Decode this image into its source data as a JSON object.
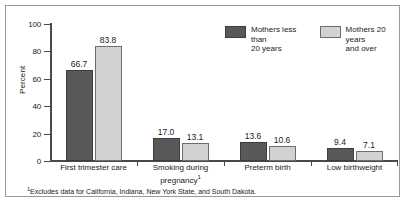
{
  "chart_data": {
    "type": "bar",
    "title": "",
    "xlabel": "",
    "ylabel": "Percent",
    "ylim": [
      0,
      100
    ],
    "yticks": [
      0,
      20,
      40,
      60,
      80,
      100
    ],
    "ytick_labels": [
      "0",
      "20",
      "40",
      "60",
      "80",
      "100"
    ],
    "grid": false,
    "legend_position": "top-right",
    "categories": [
      "First trimester care",
      "Smoking during\npregnancy",
      "Preterm birth",
      "Low birthweight"
    ],
    "category_footnotes": [
      "",
      "1",
      "",
      ""
    ],
    "series": [
      {
        "name": "Mothers less than\n20 years",
        "color": "#595959",
        "values": [
          66.7,
          17.0,
          13.6,
          9.4
        ],
        "value_labels": [
          "66.7",
          "17.0",
          "13.6",
          "9.4"
        ]
      },
      {
        "name": "Mothers 20 years\nand over",
        "color": "#d2d2d2",
        "values": [
          83.8,
          13.1,
          10.6,
          7.1
        ],
        "value_labels": [
          "83.8",
          "13.1",
          "10.6",
          "7.1"
        ]
      }
    ],
    "footnote": "Excludes data for California, Indiana, New York State, and South Dakota.",
    "footnote_marker": "1"
  },
  "legend": {
    "items": [
      {
        "label": "Mothers less than\n20 years",
        "swatch": "dark-swatch-icon"
      },
      {
        "label": "Mothers 20 years\nand over",
        "swatch": "light-swatch-icon"
      }
    ]
  },
  "axis": {
    "y_label": "Percent",
    "y_ticks": [
      "100",
      "80",
      "60",
      "40",
      "20",
      "0"
    ]
  },
  "groups": [
    {
      "label": "First trimester care",
      "footnote": "",
      "bars": [
        {
          "value_label": "66.7",
          "value": 66.7,
          "style": "dark"
        },
        {
          "value_label": "83.8",
          "value": 83.8,
          "style": "light"
        }
      ]
    },
    {
      "label": "Smoking during\npregnancy",
      "footnote": "1",
      "bars": [
        {
          "value_label": "17.0",
          "value": 17.0,
          "style": "dark"
        },
        {
          "value_label": "13.1",
          "value": 13.1,
          "style": "light"
        }
      ]
    },
    {
      "label": "Preterm birth",
      "footnote": "",
      "bars": [
        {
          "value_label": "13.6",
          "value": 13.6,
          "style": "dark"
        },
        {
          "value_label": "10.6",
          "value": 10.6,
          "style": "light"
        }
      ]
    },
    {
      "label": "Low birthweight",
      "footnote": "",
      "bars": [
        {
          "value_label": "9.4",
          "value": 9.4,
          "style": "dark"
        },
        {
          "value_label": "7.1",
          "value": 7.1,
          "style": "light"
        }
      ]
    }
  ],
  "footnote": {
    "marker": "1",
    "text": "Excludes data for California, Indiana, New York State, and South Dakota."
  }
}
